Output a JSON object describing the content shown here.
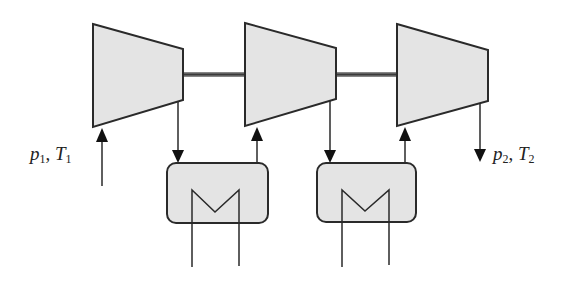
{
  "diagram": {
    "colors": {
      "fill": "#e4e4e4",
      "stroke": "#2a2a2a",
      "shaft": "#5a5a5a",
      "background": "#ffffff"
    },
    "inlet_label": {
      "p": "p",
      "p_sub": "1",
      "sep": ", ",
      "T": "T",
      "T_sub": "1"
    },
    "outlet_label": {
      "p": "p",
      "p_sub": "2",
      "sep": ", ",
      "T": "T",
      "T_sub": "2"
    },
    "components": [
      {
        "id": "compressor-1",
        "type": "compressor"
      },
      {
        "id": "intercooler-1",
        "type": "heat-exchanger"
      },
      {
        "id": "compressor-2",
        "type": "compressor"
      },
      {
        "id": "intercooler-2",
        "type": "heat-exchanger"
      },
      {
        "id": "compressor-3",
        "type": "compressor"
      }
    ]
  }
}
